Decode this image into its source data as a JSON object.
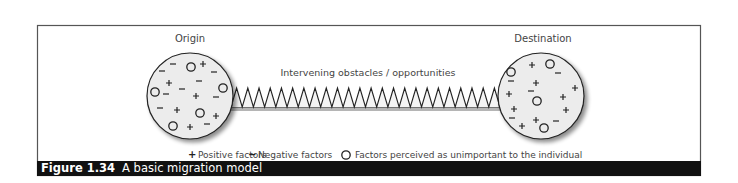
{
  "diagram": {
    "origin": {
      "label": "Origin",
      "symbols": [
        {
          "type": "minus",
          "x": 173,
          "y": 64
        },
        {
          "type": "circle",
          "x": 191,
          "y": 67
        },
        {
          "type": "plus",
          "x": 203,
          "y": 64
        },
        {
          "type": "minus",
          "x": 162,
          "y": 71
        },
        {
          "type": "minus",
          "x": 214,
          "y": 72
        },
        {
          "type": "plus",
          "x": 169,
          "y": 83
        },
        {
          "type": "minus",
          "x": 199,
          "y": 81
        },
        {
          "type": "minus",
          "x": 182,
          "y": 89
        },
        {
          "type": "circle",
          "x": 223,
          "y": 88
        },
        {
          "type": "circle",
          "x": 155,
          "y": 92
        },
        {
          "type": "minus",
          "x": 166,
          "y": 94
        },
        {
          "type": "plus",
          "x": 196,
          "y": 96
        },
        {
          "type": "minus",
          "x": 216,
          "y": 97
        },
        {
          "type": "minus",
          "x": 160,
          "y": 108
        },
        {
          "type": "plus",
          "x": 177,
          "y": 110
        },
        {
          "type": "circle",
          "x": 200,
          "y": 113
        },
        {
          "type": "plus",
          "x": 216,
          "y": 116
        },
        {
          "type": "circle",
          "x": 173,
          "y": 126
        },
        {
          "type": "plus",
          "x": 190,
          "y": 127
        },
        {
          "type": "minus",
          "x": 207,
          "y": 124
        }
      ]
    },
    "destination": {
      "label": "Destination",
      "symbols": [
        {
          "type": "circle",
          "x": 511,
          "y": 72
        },
        {
          "type": "minus",
          "x": 511,
          "y": 81
        },
        {
          "type": "plus",
          "x": 532,
          "y": 65
        },
        {
          "type": "circle",
          "x": 550,
          "y": 64
        },
        {
          "type": "minus",
          "x": 558,
          "y": 73
        },
        {
          "type": "plus",
          "x": 536,
          "y": 83
        },
        {
          "type": "minus",
          "x": 531,
          "y": 91
        },
        {
          "type": "plus",
          "x": 575,
          "y": 88
        },
        {
          "type": "plus",
          "x": 509,
          "y": 94
        },
        {
          "type": "circle",
          "x": 537,
          "y": 101
        },
        {
          "type": "plus",
          "x": 563,
          "y": 97
        },
        {
          "type": "plus",
          "x": 514,
          "y": 109
        },
        {
          "type": "plus",
          "x": 566,
          "y": 110
        },
        {
          "type": "minus",
          "x": 512,
          "y": 118
        },
        {
          "type": "plus",
          "x": 536,
          "y": 120
        },
        {
          "type": "minus",
          "x": 556,
          "y": 121
        },
        {
          "type": "plus",
          "x": 522,
          "y": 126
        },
        {
          "type": "circle",
          "x": 544,
          "y": 128
        }
      ]
    },
    "connector": {
      "label": "Intervening obstacles / opportunities",
      "teeth": 24
    },
    "legend": [
      {
        "symbol": "+",
        "label": "Positive factors"
      },
      {
        "symbol": "−",
        "label": "Negative factors"
      },
      {
        "symbol": "O",
        "label": "Factors perceived as unimportant to the individual"
      }
    ]
  },
  "caption": {
    "number": "Figure 1.34",
    "title": "A basic migration model"
  },
  "colors": {
    "circle_fill": "#ececec",
    "stroke": "#222222",
    "frame": "#555555",
    "caption_bg": "#111111",
    "text": "#333333"
  }
}
